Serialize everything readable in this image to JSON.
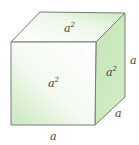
{
  "figure": {
    "type": "cube",
    "colors": {
      "edge": "#7a7a7a",
      "face_green": "#c9e8bd",
      "face_light": "#ffffff"
    },
    "labels": {
      "top_face": {
        "base": "a",
        "exp": "2"
      },
      "front_face": {
        "base": "a",
        "exp": "2"
      },
      "side_face": {
        "base": "a",
        "exp": "2"
      },
      "bottom_edge": "a",
      "right_edge": "a",
      "depth_edge": "a"
    }
  }
}
